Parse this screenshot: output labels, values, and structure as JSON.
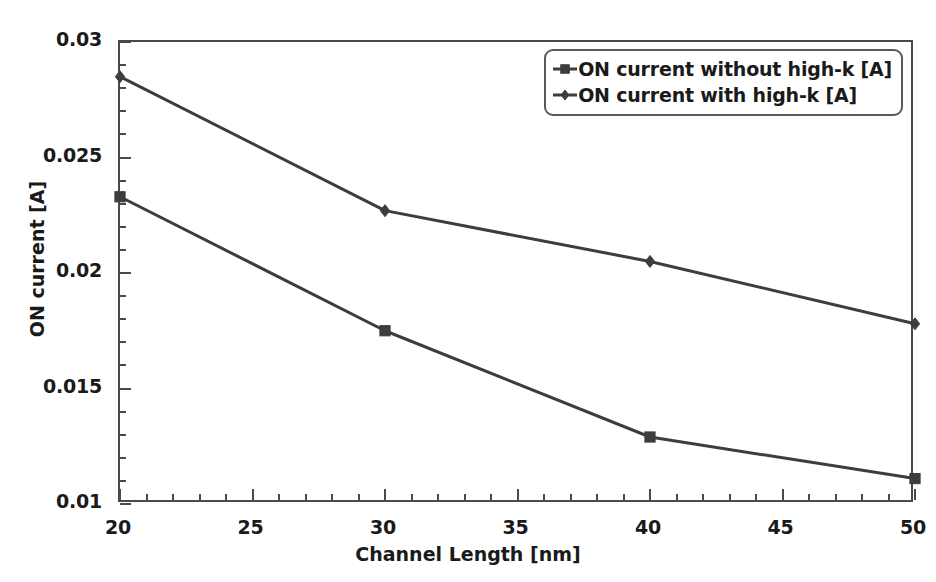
{
  "chart_data": {
    "type": "line",
    "title": "",
    "xlabel": "Channel Length [nm]",
    "ylabel": "ON current [A]",
    "x": [
      20,
      30,
      40,
      50
    ],
    "xlim": [
      20,
      50
    ],
    "ylim": [
      0.01,
      0.03
    ],
    "xticks": [
      20,
      25,
      30,
      35,
      40,
      45,
      50
    ],
    "xtick_labels": [
      "20",
      "25",
      "30",
      "35",
      "40",
      "45",
      "50"
    ],
    "x_minor_step": 1,
    "yticks": [
      0.01,
      0.015,
      0.02,
      0.025,
      0.03
    ],
    "ytick_labels": [
      "0.01",
      "0.015",
      "0.02",
      "0.025",
      "0.03"
    ],
    "y_minor_step": 0.001,
    "grid": false,
    "legend_position": "top-right",
    "series": [
      {
        "name": "ON current without high-k [A]",
        "marker": "square",
        "color": "#3d3d3d",
        "values": [
          0.0233,
          0.0175,
          0.0129,
          0.0111
        ]
      },
      {
        "name": "ON current with high-k [A]",
        "marker": "diamond",
        "color": "#3d3d3d",
        "values": [
          0.0285,
          0.0227,
          0.0205,
          0.0178
        ]
      }
    ]
  },
  "colors": {
    "background": "#ffffff",
    "axis": "#4a4a4a",
    "text": "#1a1a1a",
    "line": "#3d3d3d"
  }
}
